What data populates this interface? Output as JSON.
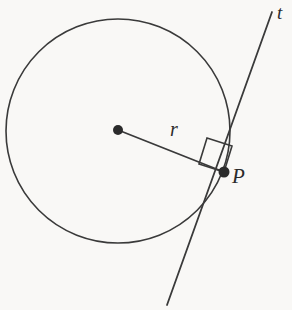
{
  "figure": {
    "width": 292,
    "height": 310,
    "background_color": "#f9f8f6",
    "stroke_color": "#3a3a3a",
    "label_color": "#2b2b2b"
  },
  "labels": {
    "radius": "r",
    "point": "P",
    "tangent": "t"
  },
  "chart_data": {
    "type": "diagram",
    "elements": [
      {
        "name": "circle",
        "kind": "circle",
        "center": [
          118,
          131
        ],
        "radius": 112,
        "stroke": "#3a3a3a",
        "stroke_width": 1.6,
        "fill": "none"
      },
      {
        "name": "center-point",
        "kind": "point",
        "position": [
          118,
          130
        ],
        "dot_radius": 5,
        "fill": "#2b2b2b"
      },
      {
        "name": "tangent-point",
        "kind": "point",
        "label": "P",
        "position": [
          224,
          172
        ],
        "dot_radius": 5.5,
        "fill": "#2b2b2b"
      },
      {
        "name": "radius-segment",
        "kind": "segment",
        "label": "r",
        "from": [
          118,
          130
        ],
        "to": [
          224,
          172
        ],
        "stroke": "#3a3a3a",
        "stroke_width": 1.8
      },
      {
        "name": "tangent-line",
        "kind": "line",
        "label": "t",
        "from": [
          272,
          12
        ],
        "to": [
          167,
          305
        ],
        "through": [
          224,
          172
        ],
        "stroke": "#3a3a3a",
        "stroke_width": 1.8
      },
      {
        "name": "right-angle-marker",
        "kind": "square",
        "vertices": [
          [
            224,
            172
          ],
          [
            232,
            146
          ],
          [
            207,
            138
          ],
          [
            199,
            164
          ]
        ],
        "stroke": "#3a3a3a",
        "stroke_width": 1.6,
        "fill": "none",
        "angle_degrees": 90
      }
    ],
    "annotations": [
      {
        "text": "r",
        "position": [
          178,
          133
        ],
        "style": "italic"
      },
      {
        "text": "P",
        "position": [
          240,
          178
        ],
        "style": "italic"
      },
      {
        "text": "t",
        "position": [
          283,
          12
        ],
        "style": "italic"
      }
    ]
  }
}
